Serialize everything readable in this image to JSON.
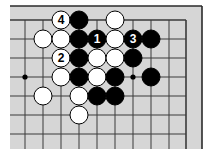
{
  "diagram": {
    "type": "go-board-fragment",
    "colors": {
      "board": "#d6d6d6",
      "grid": "#3a3a3a",
      "frame": "#2a2a2a",
      "black_stone": "#000000",
      "white_stone": "#ffffff"
    },
    "grid": {
      "columns_x": [
        25,
        43,
        61,
        79,
        97,
        115,
        133,
        151,
        169,
        186
      ],
      "rows_y": [
        20,
        39,
        58,
        77,
        96,
        115,
        134
      ],
      "top_edge": true,
      "right_edge": true
    },
    "star_points": [
      {
        "col": 0,
        "row": 3
      },
      {
        "col": 6,
        "row": 3
      }
    ],
    "stones": [
      {
        "color": "white",
        "col": 2,
        "row": 0,
        "label": "4"
      },
      {
        "color": "black",
        "col": 3,
        "row": 0,
        "label": ""
      },
      {
        "color": "white",
        "col": 5,
        "row": 0,
        "label": ""
      },
      {
        "color": "white",
        "col": 1,
        "row": 1,
        "label": ""
      },
      {
        "color": "white",
        "col": 2,
        "row": 1,
        "label": ""
      },
      {
        "color": "black",
        "col": 3,
        "row": 1,
        "label": ""
      },
      {
        "color": "black",
        "col": 4,
        "row": 1,
        "label": "1"
      },
      {
        "color": "white",
        "col": 5,
        "row": 1,
        "label": ""
      },
      {
        "color": "black",
        "col": 6,
        "row": 1,
        "label": "3"
      },
      {
        "color": "black",
        "col": 7,
        "row": 1,
        "label": ""
      },
      {
        "color": "white",
        "col": 2,
        "row": 2,
        "label": "2"
      },
      {
        "color": "black",
        "col": 3,
        "row": 2,
        "label": ""
      },
      {
        "color": "white",
        "col": 4,
        "row": 2,
        "label": ""
      },
      {
        "color": "white",
        "col": 5,
        "row": 2,
        "label": ""
      },
      {
        "color": "black",
        "col": 6,
        "row": 2,
        "label": ""
      },
      {
        "color": "white",
        "col": 2,
        "row": 3,
        "label": ""
      },
      {
        "color": "black",
        "col": 3,
        "row": 3,
        "label": ""
      },
      {
        "color": "white",
        "col": 4,
        "row": 3,
        "label": ""
      },
      {
        "color": "black",
        "col": 5,
        "row": 3,
        "label": ""
      },
      {
        "color": "black",
        "col": 7,
        "row": 3,
        "label": ""
      },
      {
        "color": "white",
        "col": 1,
        "row": 4,
        "label": ""
      },
      {
        "color": "white",
        "col": 3,
        "row": 4,
        "label": ""
      },
      {
        "color": "black",
        "col": 4,
        "row": 4,
        "label": ""
      },
      {
        "color": "black",
        "col": 5,
        "row": 4,
        "label": ""
      },
      {
        "color": "white",
        "col": 3,
        "row": 5,
        "label": ""
      }
    ]
  }
}
